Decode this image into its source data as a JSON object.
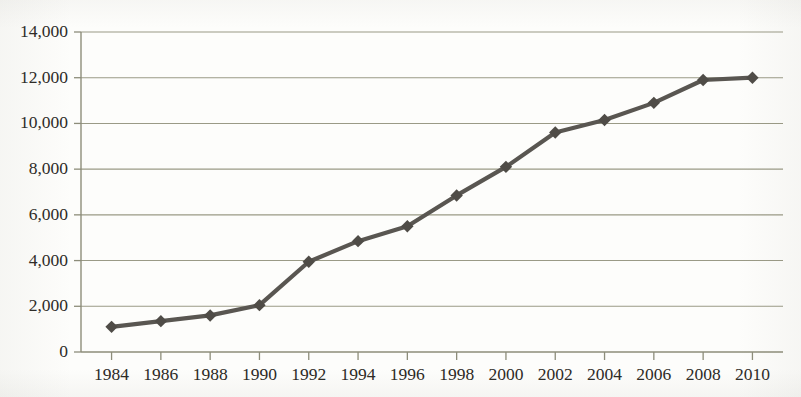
{
  "chart_data": {
    "type": "line",
    "title": "",
    "subtitle": "",
    "xlabel": "",
    "ylabel": "",
    "categories": [
      "1984",
      "1986",
      "1988",
      "1990",
      "1992",
      "1994",
      "1996",
      "1998",
      "2000",
      "2002",
      "2004",
      "2006",
      "2008",
      "2010"
    ],
    "x": [
      1984,
      1986,
      1988,
      1990,
      1992,
      1994,
      1996,
      1998,
      2000,
      2002,
      2004,
      2006,
      2008,
      2010
    ],
    "values": [
      1100,
      1350,
      1600,
      2050,
      3950,
      4850,
      5500,
      6850,
      8100,
      9600,
      10150,
      10900,
      11900,
      12000
    ],
    "series": [
      {
        "name": "",
        "values": [
          1100,
          1350,
          1600,
          2050,
          3950,
          4850,
          5500,
          6850,
          8100,
          9600,
          10150,
          10900,
          11900,
          12000
        ]
      }
    ],
    "ylim": [
      0,
      14000
    ],
    "xlim": [
      1984,
      2010
    ],
    "ytick_labels": [
      "0",
      "2,000",
      "4,000",
      "6,000",
      "8,000",
      "10,000",
      "12,000",
      "14,000"
    ],
    "ytick_values": [
      0,
      2000,
      4000,
      6000,
      8000,
      10000,
      12000,
      14000
    ],
    "xtick_labels": [
      "1984",
      "1986",
      "1988",
      "1990",
      "1992",
      "1994",
      "1996",
      "1998",
      "2000",
      "2002",
      "2004",
      "2006",
      "2008",
      "2010"
    ],
    "grid": "horizontal",
    "legend": "none",
    "marker": "diamond",
    "annotations": [],
    "colors": {
      "line": "#595651",
      "marker": "#4f4c47",
      "gridline": "#9a9a86",
      "axis": "#8d8d7a",
      "text": "#2c2a26",
      "background": "#fdfdfb"
    }
  }
}
